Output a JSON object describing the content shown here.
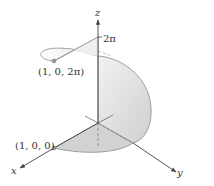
{
  "figure": {
    "type": "3d-parametric-surface",
    "axes": {
      "x_label": "x",
      "y_label": "y",
      "z_label": "z"
    },
    "z_tick_label": "2π",
    "points": [
      {
        "label": "(1, 0, 0)",
        "role": "start"
      },
      {
        "label": "(1, 0, 2π)",
        "role": "end"
      }
    ],
    "colors": {
      "surface_fill": "#d4d4d4",
      "surface_light": "#ececec",
      "edge": "#8a8a8a",
      "axis": "#444444",
      "point": "#9a9a9a",
      "background": "#ffffff"
    }
  }
}
